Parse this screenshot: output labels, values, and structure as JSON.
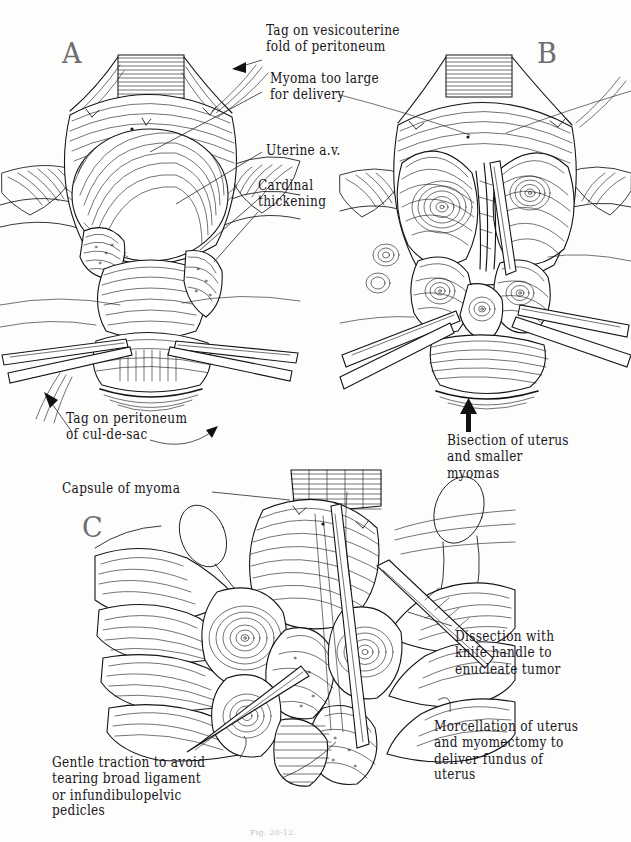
{
  "plate": {
    "background": "#fdfdfc",
    "ink_color": "#15131a",
    "panel_letter_color": "#6e6c70",
    "width": 631,
    "height": 842
  },
  "panels": [
    {
      "id": "A",
      "letter": "A",
      "title": "Uterus with large anterior myoma, peritoneum tagged"
    },
    {
      "id": "B",
      "letter": "B",
      "title": "Uterus bisected exposing multiple myomas"
    },
    {
      "id": "C",
      "letter": "C",
      "title": "Enucleation of myomas by hand and knife handle"
    }
  ],
  "labels": {
    "tag_vesicouterine": "Tag on vesicouterine\nfold of peritoneum",
    "myoma_too_large": "Myoma too large\nfor delivery",
    "uterine_av": "Uterine a.v.",
    "cardinal_thickening": "Cardinal\nthickening",
    "tag_culdesac": "Tag on peritoneum\nof cul-de-sac",
    "bisection": "Bisection of uterus\nand smaller\nmyomas",
    "capsule_of_myoma": "Capsule of myoma",
    "dissection_knife": "Dissection with\nknife handle to\nenucleate tumor",
    "morcellation": "Morcellation of uterus\nand myomectomy to\ndeliver fundus of\nuterus",
    "gentle_traction": "Gentle traction to avoid\ntearing broad ligament\nor infundibulopelvic\npedicles"
  },
  "figure_caption": "Fig. 20-12.",
  "icons": {
    "arrow_left": "arrow-left-icon",
    "arrow_up": "arrow-up-icon",
    "arrow_upleft": "arrow-up-left-icon",
    "arrow_curve_right": "curved-arrow-right-icon"
  }
}
